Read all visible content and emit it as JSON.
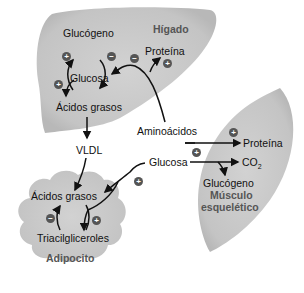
{
  "organs": {
    "liver": {
      "name": "Hígado"
    },
    "muscle": {
      "name_line1": "Músculo",
      "name_line2": "esquelético"
    },
    "adipocyte": {
      "name": "Adipocito"
    }
  },
  "labels": {
    "liver_glycogen": "Glucógeno",
    "liver_glucose": "Glucosa",
    "liver_protein": "Proteína",
    "liver_fatty_acids": "Ácidos grasos",
    "amino_acids": "Aminoácidos",
    "vldl": "VLDL",
    "blood_glucose": "Glucosa",
    "muscle_protein": "Proteína",
    "co2": "CO",
    "co2_sub": "2",
    "muscle_glycogen": "Glucógeno",
    "adipo_fatty_acids": "Ácidos grasos",
    "triacylglycerols": "Triacilgliceroles"
  },
  "signs": {
    "plus": "+",
    "minus": "−"
  },
  "colors": {
    "organ_fill": "#c8c8c8",
    "sign_fill": "#555555",
    "arrow": "#111111"
  }
}
